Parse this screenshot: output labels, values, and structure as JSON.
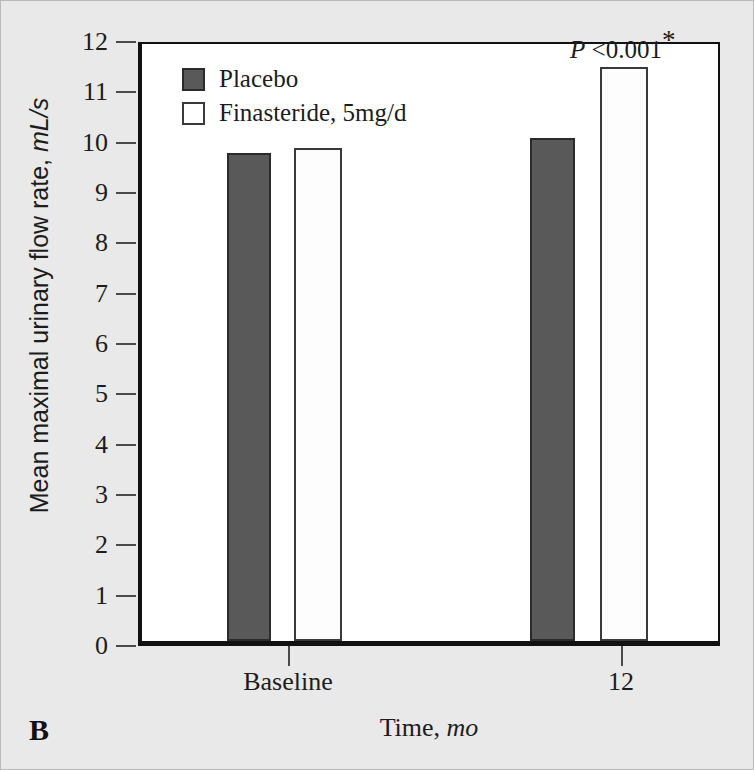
{
  "panel": {
    "label": "B"
  },
  "legend": {
    "position": "top-left-inside",
    "items": [
      {
        "label": "Placebo",
        "color": "#595959",
        "swatch": "filled-dark-square"
      },
      {
        "label": "Finasteride, 5mg/d",
        "color": "#ffffff",
        "swatch": "open-white-square"
      }
    ]
  },
  "annotations": [
    {
      "prefix_italic": "P",
      "text": " <0.001",
      "superscript": "*",
      "target_group": "12",
      "target_series": "Finasteride, 5mg/d"
    }
  ],
  "chart_data": {
    "type": "bar",
    "title": "",
    "subtitle": "",
    "xlabel_plain": "Time, ",
    "xlabel_italic": "mo",
    "ylabel_plain": "Mean maximal urinary flow rate, ",
    "ylabel_italic": "mL/s",
    "categories": [
      "Baseline",
      "12"
    ],
    "series": [
      {
        "name": "Placebo",
        "values": [
          9.7,
          10.0
        ],
        "color": "#595959"
      },
      {
        "name": "Finasteride, 5mg/d",
        "values": [
          9.8,
          11.4
        ],
        "color": "#ffffff"
      }
    ],
    "ylim": [
      0,
      12
    ],
    "ytick_step": 1,
    "yticks": [
      0,
      1,
      2,
      3,
      4,
      5,
      6,
      7,
      8,
      9,
      10,
      11,
      12
    ],
    "ytick_labels": [
      "0",
      "1",
      "2",
      "3",
      "4",
      "5",
      "6",
      "7",
      "8",
      "9",
      "10",
      "11",
      "12"
    ],
    "grid": false,
    "legend_position": "top-left-inside",
    "panel_label": "B"
  },
  "geometry": {
    "plot_left": 137,
    "plot_top": 41,
    "plot_width": 582,
    "plot_height": 604,
    "bars": [
      {
        "group": 0,
        "series": 0,
        "x": 222,
        "width": 44
      },
      {
        "group": 0,
        "series": 1,
        "x": 289,
        "width": 48
      },
      {
        "group": 1,
        "series": 0,
        "x": 525,
        "width": 45
      },
      {
        "group": 1,
        "series": 1,
        "x": 595,
        "width": 48
      }
    ],
    "xtick_positions": [
      287,
      620
    ]
  }
}
